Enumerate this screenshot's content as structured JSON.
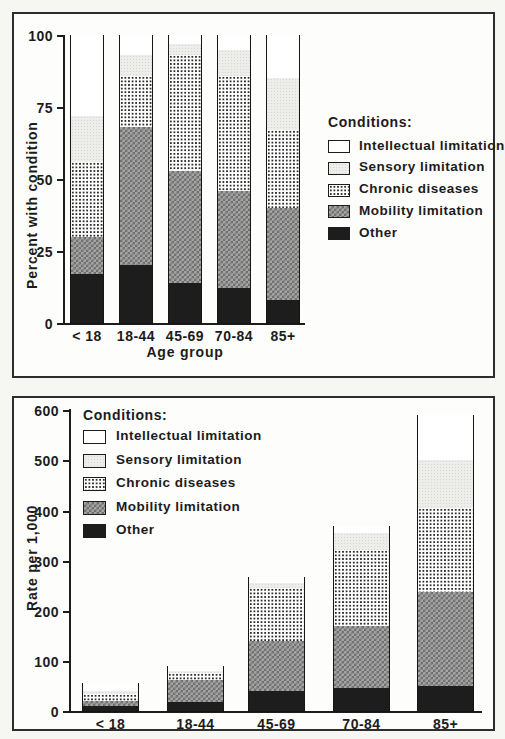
{
  "figure": {
    "legend_title": "Conditions:"
  },
  "colors": {
    "ink": "#1c1c1c",
    "other_fill": "#1d1d1d",
    "mobility_fill": "#a3a3a3",
    "sensory_fill": "#ededea",
    "intellectual_fill": "#ffffff"
  },
  "chart_data": [
    {
      "type": "bar",
      "stacked": true,
      "title": "",
      "ylabel": "Percent with condition",
      "xlabel": "Age group",
      "ylim": [
        0,
        100
      ],
      "yticks": [
        0,
        25,
        50,
        75,
        100
      ],
      "grid": false,
      "legend_title": "Conditions:",
      "legend_position": "right-outside",
      "categories": [
        "< 18",
        "18-44",
        "45-69",
        "70-84",
        "85+"
      ],
      "series": [
        {
          "name": "Other",
          "pattern": "solid-dark",
          "values": [
            17,
            20,
            14,
            12,
            8
          ]
        },
        {
          "name": "Mobility limitation",
          "pattern": "checker",
          "values": [
            13,
            48,
            39,
            34,
            32
          ]
        },
        {
          "name": "Chronic diseases",
          "pattern": "dot-grid",
          "values": [
            26,
            18,
            40,
            40,
            27
          ]
        },
        {
          "name": "Sensory limitation",
          "pattern": "stipple-light",
          "values": [
            16,
            7,
            4,
            9,
            18
          ]
        },
        {
          "name": "Intellectual limitation",
          "pattern": "plain",
          "values": [
            28,
            7,
            3,
            5,
            15
          ]
        }
      ]
    },
    {
      "type": "bar",
      "stacked": true,
      "title": "",
      "ylabel": "Rate per 1,000",
      "xlabel": "",
      "ylim": [
        0,
        600
      ],
      "yticks": [
        0,
        100,
        200,
        300,
        400,
        500,
        600
      ],
      "grid": false,
      "legend_title": "Conditions:",
      "legend_position": "top-left-inside",
      "categories": [
        "< 18",
        "18-44",
        "45-69",
        "70-84",
        "85+"
      ],
      "series": [
        {
          "name": "Other",
          "pattern": "solid-dark",
          "values": [
            10,
            18,
            40,
            45,
            50
          ]
        },
        {
          "name": "Mobility limitation",
          "pattern": "checker",
          "values": [
            9,
            43,
            100,
            125,
            187
          ]
        },
        {
          "name": "Chronic diseases",
          "pattern": "dot-grid",
          "values": [
            15,
            14,
            106,
            152,
            168
          ]
        },
        {
          "name": "Sensory limitation",
          "pattern": "stipple-light",
          "values": [
            6,
            5,
            9,
            33,
            95
          ]
        },
        {
          "name": "Intellectual limitation",
          "pattern": "plain",
          "values": [
            15,
            9,
            12,
            15,
            90
          ]
        }
      ]
    }
  ]
}
